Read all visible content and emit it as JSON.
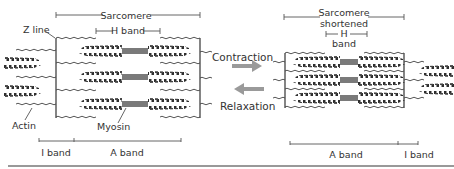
{
  "diagram": {
    "relaxed": {
      "sarcomere_label": "Sarcomere",
      "z_line_label": "Z line",
      "h_band_label": "H band",
      "actin_label": "Actin",
      "myosin_label": "Myosin",
      "i_band_label": "I band",
      "a_band_label": "A band"
    },
    "contracted": {
      "sarcomere_label_line1": "Sarcomere",
      "sarcomere_label_line2": "shortened",
      "h_band_label_line1": "H",
      "h_band_label_line2": "band",
      "a_band_label": "A band",
      "i_band_label": "I band"
    },
    "arrows": {
      "contraction_label": "Contraction",
      "relaxation_label": "Relaxation",
      "arrow_color": "#9a9a9a"
    },
    "colors": {
      "myosin_head": "#3a3a3a",
      "myosin_core": "#7a7a7a",
      "line": "#555555",
      "text": "#333333"
    }
  }
}
